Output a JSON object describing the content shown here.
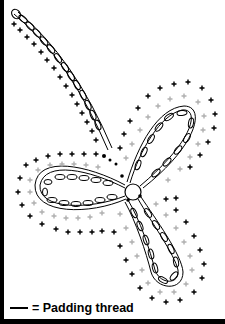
{
  "diagram": {
    "type": "crochet-chart",
    "colors": {
      "outline": "#000000",
      "chain": "#000000",
      "sc_round_1": "#b0b0b0",
      "sc_round_2": "#000000",
      "border": "#000000"
    },
    "symbols": [
      "chain-stitch-oval",
      "single-crochet-cross",
      "padding-thread-line",
      "center-ring"
    ]
  },
  "legend": {
    "symbol": "—",
    "label": "= Padding thread"
  }
}
